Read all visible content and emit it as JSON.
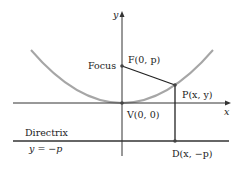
{
  "diagram": {
    "type": "parabola-focus-directrix",
    "axes": {
      "x_label": "x",
      "y_label": "y"
    },
    "points": {
      "focus": {
        "caption": "Focus",
        "label": "F(0, p)"
      },
      "point": {
        "label": "P(x, y)"
      },
      "vertex": {
        "label": "V(0, 0)"
      },
      "directrix_point": {
        "label": "D(x, −p)"
      }
    },
    "directrix": {
      "caption": "Directrix",
      "equation": "y = −p"
    },
    "colors": {
      "parabola": "#a6a6a6",
      "axes": "#333333",
      "segments": "#222222",
      "points": "#444444"
    }
  }
}
